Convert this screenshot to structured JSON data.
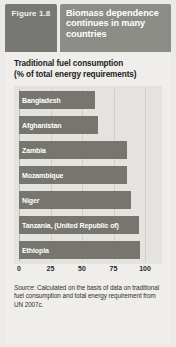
{
  "header": {
    "figure_label": "Figure",
    "figure_number": "1.8",
    "title": "Biomass dependence continues in many countries"
  },
  "chart_title_line1": "Traditional fuel consumption",
  "chart_title_line2": "(% of total energy requirements)",
  "source": {
    "label": "Source:",
    "text": "Calculated on the basis of data on traditional fuel consumption and total energy requirement from UN 2007c."
  },
  "colors": {
    "bar": "#76766f",
    "figure_box": "#787874",
    "title_box": "#8d8d88",
    "panel": "#efeeea",
    "plot_bg": "#e4e3df",
    "grid": "#cfcec9"
  },
  "chart_data": {
    "type": "bar",
    "orientation": "horizontal",
    "title": "Traditional fuel consumption (% of total energy requirements)",
    "xlabel": "",
    "ylabel": "",
    "xlim": [
      0,
      100
    ],
    "xticks": [
      0,
      25,
      50,
      75,
      100
    ],
    "grid": true,
    "legend": "none",
    "categories": [
      "Bangladesh",
      "Afghanistan",
      "Zambia",
      "Mozambique",
      "Niger",
      "Tanzania, (United Republic of)",
      "Ethiopia"
    ],
    "values": [
      60,
      63,
      86,
      86,
      89,
      95,
      96
    ]
  }
}
